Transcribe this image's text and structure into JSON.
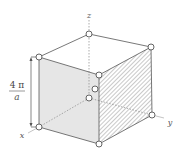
{
  "diagram": {
    "type": "cube-3d-axes",
    "axes": {
      "x_label": "x",
      "y_label": "y",
      "z_label": "z"
    },
    "dimension": {
      "numerator": "4 π",
      "denominator": "a",
      "description": "edge length 4π/a"
    },
    "vertices_count": 8,
    "extra_points_count": 2,
    "faces": {
      "front_left": "shaded gray",
      "front_right": "hatched"
    },
    "colors": {
      "line": "#555555",
      "shade": "#e6e6e6",
      "hatch": "#777777",
      "vertex_fill": "#ffffff",
      "vertex_stroke": "#555555"
    }
  }
}
